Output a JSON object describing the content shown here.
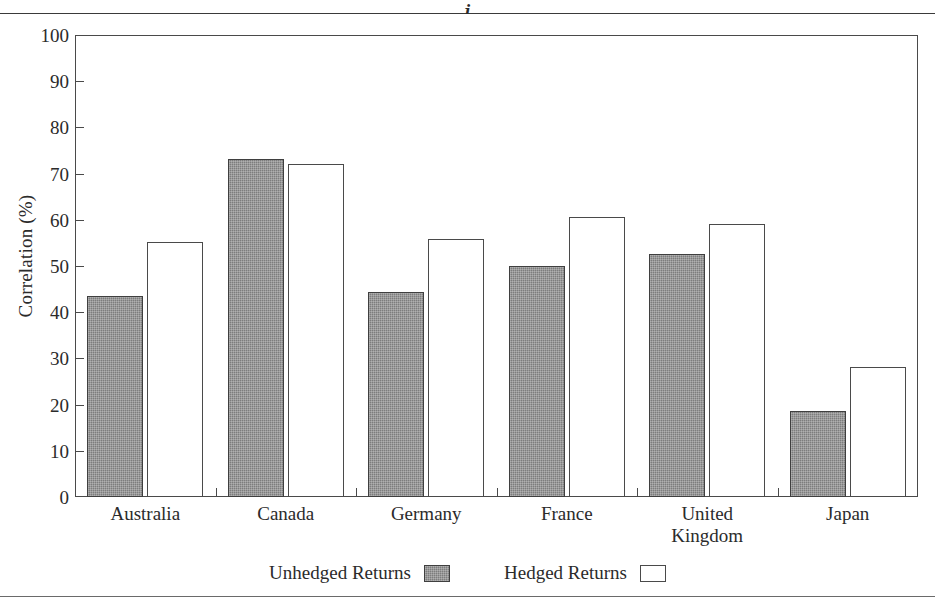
{
  "figure": {
    "title_fragment": "j",
    "has_top_rule": true,
    "has_bottom_rule": true
  },
  "chart_data": {
    "type": "bar",
    "title": "",
    "xlabel": "",
    "ylabel": "Correlation (%)",
    "ylim": [
      0,
      100
    ],
    "ytick_step": 10,
    "yticks": [
      0,
      10,
      20,
      30,
      40,
      50,
      60,
      70,
      80,
      90,
      100
    ],
    "ytick_labels": [
      "0",
      "10",
      "20",
      "30",
      "40",
      "50",
      "60",
      "70",
      "80",
      "90",
      "100"
    ],
    "grid": false,
    "legend_position": "bottom-center",
    "categories": [
      "Australia",
      "Canada",
      "Germany",
      "France",
      "United\nKingdom",
      "Japan"
    ],
    "series": [
      {
        "name": "Unhedged Returns",
        "style": "filled-gray",
        "color": "#7d7d7d",
        "values": [
          43.5,
          73.2,
          44.4,
          50.0,
          52.6,
          18.6
        ]
      },
      {
        "name": "Hedged Returns",
        "style": "outline-white",
        "color": "#ffffff",
        "values": [
          55.1,
          72.0,
          55.8,
          60.6,
          59.2,
          28.1
        ]
      }
    ]
  },
  "legend": {
    "entries": [
      {
        "label": "Unhedged Returns",
        "swatch": "filled"
      },
      {
        "label": "Hedged Returns",
        "swatch": "outline"
      }
    ]
  },
  "colors": {
    "unhedged_fill": "#7d7d7d",
    "hedged_fill": "#ffffff",
    "axis": "#4a4a4a",
    "text": "#2b2b2b",
    "background": "#ffffff"
  }
}
